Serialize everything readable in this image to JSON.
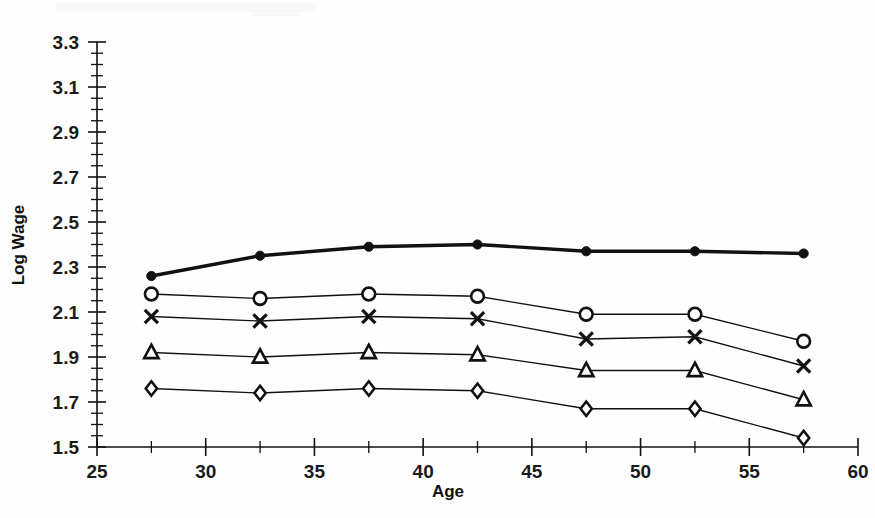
{
  "chart_data": {
    "type": "line",
    "title": "",
    "xlabel": "Age",
    "ylabel": "Log Wage",
    "xlim": [
      25,
      60
    ],
    "ylim": [
      1.5,
      3.3
    ],
    "x": [
      27.5,
      32.5,
      37.5,
      42.5,
      47.5,
      52.5,
      57.5
    ],
    "xticks": [
      25,
      30,
      35,
      40,
      45,
      50,
      55,
      60
    ],
    "xtick_labels": [
      "25",
      "30",
      "35",
      "40",
      "45",
      "50",
      "55",
      "60"
    ],
    "x_minor_step": 2.5,
    "yticks": [
      1.5,
      1.7,
      1.9,
      2.1,
      2.3,
      2.5,
      2.7,
      2.9,
      3.1,
      3.3
    ],
    "ytick_labels": [
      "1.5",
      "1.7",
      "1.9",
      "2.1",
      "2.3",
      "2.5",
      "2.7",
      "2.9",
      "3.1",
      "3.3"
    ],
    "y_minor_step": 0.05,
    "grid": false,
    "legend": "none",
    "series": [
      {
        "name": "series-filled-circle",
        "marker": "filled-circle",
        "line_weight": "thick",
        "values": [
          2.26,
          2.35,
          2.39,
          2.4,
          2.37,
          2.37,
          2.36
        ]
      },
      {
        "name": "series-open-circle",
        "marker": "open-circle",
        "line_weight": "thin",
        "values": [
          2.18,
          2.16,
          2.18,
          2.17,
          2.09,
          2.09,
          1.97
        ]
      },
      {
        "name": "series-cross",
        "marker": "cross",
        "line_weight": "thin",
        "values": [
          2.08,
          2.06,
          2.08,
          2.07,
          1.98,
          1.99,
          1.86
        ]
      },
      {
        "name": "series-triangle",
        "marker": "open-triangle",
        "line_weight": "thin",
        "values": [
          1.92,
          1.9,
          1.92,
          1.91,
          1.84,
          1.84,
          1.71
        ]
      },
      {
        "name": "series-diamond",
        "marker": "open-diamond",
        "line_weight": "thin",
        "values": [
          1.76,
          1.74,
          1.76,
          1.75,
          1.67,
          1.67,
          1.54
        ]
      }
    ]
  },
  "colors": {
    "ink": "#111111",
    "background": "#ffffff"
  }
}
